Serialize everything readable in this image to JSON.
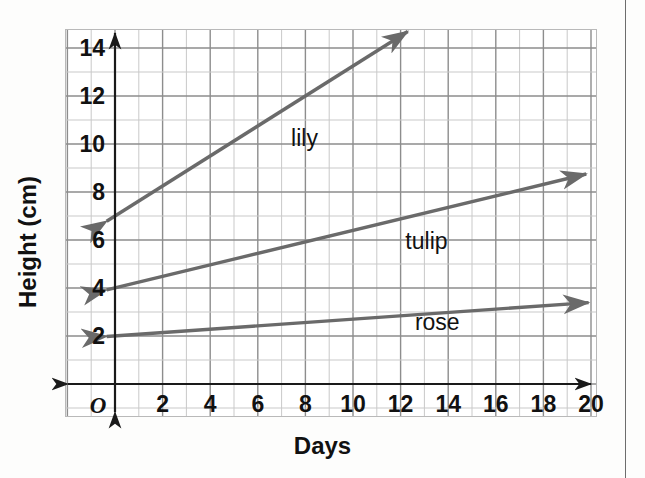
{
  "figure": {
    "background_color": "#ffffff",
    "page_rule_color": "#6d6d6d"
  },
  "chart_data": {
    "type": "line",
    "title": "",
    "subtitle": "",
    "xlabel": "Days",
    "ylabel": "Height (cm)",
    "origin_label": "O",
    "xlim": [
      0,
      20
    ],
    "ylim": [
      0,
      15
    ],
    "xticks": [
      2,
      4,
      6,
      8,
      10,
      12,
      14,
      16,
      18,
      20
    ],
    "xtick_labels": [
      "2",
      "4",
      "6",
      "8",
      "10",
      "12",
      "14",
      "16",
      "18",
      "20"
    ],
    "yticks": [
      2,
      4,
      6,
      8,
      10,
      12,
      14
    ],
    "ytick_labels": [
      "2",
      "4",
      "6",
      "8",
      "10",
      "12",
      "14"
    ],
    "grid": true,
    "grid_minor_step": 1,
    "grid_major_step": 2,
    "grid_minor_color": "#c9c9c9",
    "grid_major_color": "#8d8d8d",
    "axis_color": "#1a1a1a",
    "line_color": "#6a6a6a",
    "legend": "inline-labels",
    "legend_position": "on-plot",
    "series": [
      {
        "name": "lily",
        "label": "lily",
        "intercept": 7,
        "slope": 0.625,
        "x_start": -0.35,
        "x_end": 12.3,
        "y_start": 6.78,
        "y_end": 14.69,
        "points": [
          [
            0,
            7
          ],
          [
            4,
            9.5
          ],
          [
            8,
            12
          ],
          [
            12,
            14.5
          ]
        ],
        "label_x": 7.4,
        "label_y": 10.2,
        "arrow": "double"
      },
      {
        "name": "tulip",
        "label": "tulip",
        "intercept": 4,
        "slope": 0.24,
        "x_start": -0.35,
        "x_end": 19.8,
        "y_start": 3.92,
        "y_end": 8.75,
        "points": [
          [
            0,
            4
          ],
          [
            5,
            5.2
          ],
          [
            10,
            6.4
          ],
          [
            15,
            7.6
          ],
          [
            20,
            8.8
          ]
        ],
        "label_x": 12.2,
        "label_y": 5.9,
        "arrow": "double"
      },
      {
        "name": "rose",
        "label": "rose",
        "intercept": 2,
        "slope": 0.07,
        "x_start": -0.35,
        "x_end": 19.9,
        "y_start": 1.98,
        "y_end": 3.39,
        "points": [
          [
            0,
            2
          ],
          [
            5,
            2.35
          ],
          [
            10,
            2.7
          ],
          [
            15,
            3.05
          ],
          [
            20,
            3.4
          ]
        ],
        "label_x": 12.6,
        "label_y": 2.55,
        "arrow": "double"
      }
    ]
  }
}
